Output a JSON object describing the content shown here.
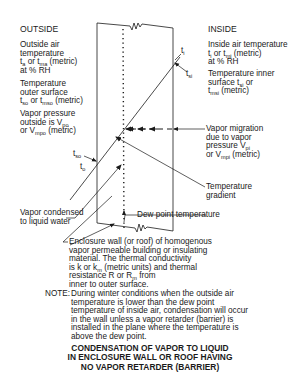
{
  "outside": {
    "heading": "OUTSIDE",
    "air_temp": {
      "line1": "Outside air",
      "line2": "temperature",
      "line3_pre": "t",
      "line3_sub1": "a",
      "line3_mid": " or t",
      "line3_sub2": "ma",
      "line3_post": " (metric)",
      "line4": "at % RH"
    },
    "surface_temp": {
      "line1": "Temperature",
      "line2": "outer surface",
      "line3_pre": "t",
      "line3_sub1": "so",
      "line3_mid": " or t",
      "line3_sub2": "mso",
      "line3_post": " (metric)"
    },
    "vapor_pressure": {
      "line1": "Vapor pressure",
      "line2_pre": "outside is V",
      "line2_sub": "po",
      "line3_pre": "or V",
      "line3_sub": "mpo",
      "line3_post": " (metric)"
    }
  },
  "inside": {
    "heading": "INSIDE",
    "air_temp": {
      "line1": "Inside air temperature",
      "line2_pre": "t",
      "line2_sub1": "i",
      "line2_mid": " or t",
      "line2_sub2": "mi",
      "line2_post": " (metric)",
      "line3": "at % RH"
    },
    "surface_temp": {
      "line1": "Temperature inner",
      "line2_pre": "surface t",
      "line2_sub": "si",
      "line2_post": " or",
      "line3_pre": "t",
      "line3_sub": "msi",
      "line3_post": " (metric)"
    }
  },
  "diagram_labels": {
    "ti": "t",
    "ti_sub": "i",
    "tsi": "t",
    "tsi_sub": "si",
    "tso": "t",
    "tso_sub": "so",
    "to": "t",
    "to_sub": "o"
  },
  "callouts": {
    "vapor_migration": {
      "line1": "Vapor migration",
      "line2": "due to vapor",
      "line3_pre": "pressure V",
      "line3_sub": "pi",
      "line4_pre": "or V",
      "line4_sub": "mpi",
      "line4_post": " (metric)"
    },
    "temperature_gradient": {
      "line1": "Temperature",
      "line2": "gradient"
    },
    "dew_point": "Dew point temperature",
    "vapor_condensed": {
      "line1": "Vapor condensed",
      "line2": "to liquid water"
    },
    "enclosure_wall": {
      "line1": "Enclosure wall (or roof) of homogenous",
      "line2": "vapor permeable building or insulating",
      "line3": "material. The thermal conductivity",
      "line4_pre": "is k or k",
      "line4_sub": "m",
      "line4_post": " (metric units) and thermal",
      "line5_pre": "resistance R or R",
      "line5_sub": "m",
      "line5_post": " from",
      "line6": "inner to outer surface."
    }
  },
  "note": {
    "label": "NOTE:",
    "lines": [
      "During winter conditions when the outside air",
      "temperature is lower than the dew point",
      "temperature of inside air, condensation will occur",
      "in the wall unless a vapor retarder (barrier) is",
      "installed in the plane where the temperature is",
      "above the dew point."
    ]
  },
  "title": {
    "lines": [
      "CONDENSATION OF VAPOR TO LIQUID",
      "IN ENCLOSURE WALL OR ROOF HAVING",
      "NO VAPOR RETARDER (BARRIER)"
    ]
  },
  "colors": {
    "ink": "#1a1a1a",
    "background": "#ffffff"
  }
}
